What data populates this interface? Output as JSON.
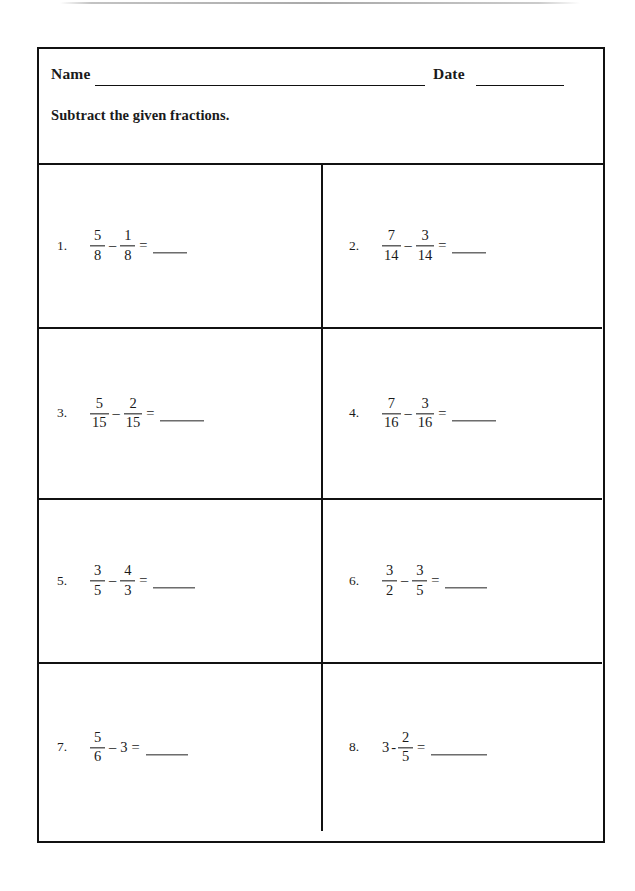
{
  "header": {
    "name_label": "Name",
    "date_label": "Date",
    "instruction": "Subtract the given fractions."
  },
  "problems": [
    {
      "number": "1.",
      "left": {
        "type": "fraction",
        "numerator": "5",
        "denominator": "8"
      },
      "operator": "–",
      "right": {
        "type": "fraction",
        "numerator": "1",
        "denominator": "8"
      },
      "equals": "=",
      "answer": "",
      "blank_width": 34
    },
    {
      "number": "2.",
      "left": {
        "type": "fraction",
        "numerator": "7",
        "denominator": "14"
      },
      "operator": "–",
      "right": {
        "type": "fraction",
        "numerator": "3",
        "denominator": "14"
      },
      "equals": "=",
      "answer": "",
      "blank_width": 34
    },
    {
      "number": "3.",
      "left": {
        "type": "fraction",
        "numerator": "5",
        "denominator": "15"
      },
      "operator": "–",
      "right": {
        "type": "fraction",
        "numerator": "2",
        "denominator": "15"
      },
      "equals": "=",
      "answer": "",
      "blank_width": 44
    },
    {
      "number": "4.",
      "left": {
        "type": "fraction",
        "numerator": "7",
        "denominator": "16"
      },
      "operator": "–",
      "right": {
        "type": "fraction",
        "numerator": "3",
        "denominator": "16"
      },
      "equals": "=",
      "answer": "",
      "blank_width": 44
    },
    {
      "number": "5.",
      "left": {
        "type": "fraction",
        "numerator": "3",
        "denominator": "5"
      },
      "operator": "–",
      "right": {
        "type": "fraction",
        "numerator": "4",
        "denominator": "3"
      },
      "equals": "=",
      "answer": "",
      "blank_width": 42
    },
    {
      "number": "6.",
      "left": {
        "type": "fraction",
        "numerator": "3",
        "denominator": "2"
      },
      "operator": "–",
      "right": {
        "type": "fraction",
        "numerator": "3",
        "denominator": "5"
      },
      "equals": "=",
      "answer": "",
      "blank_width": 42
    },
    {
      "number": "7.",
      "left": {
        "type": "fraction",
        "numerator": "5",
        "denominator": "6"
      },
      "operator": "–",
      "right": {
        "type": "whole",
        "value": "3"
      },
      "equals": "=",
      "answer": "",
      "blank_width": 42
    },
    {
      "number": "8.",
      "left": {
        "type": "whole",
        "value": "3"
      },
      "operator": "-",
      "right": {
        "type": "fraction",
        "numerator": "2",
        "denominator": "5"
      },
      "equals": "=",
      "answer": "",
      "blank_width": 56
    }
  ],
  "colors": {
    "ink": "#111111",
    "paper": "#ffffff"
  }
}
